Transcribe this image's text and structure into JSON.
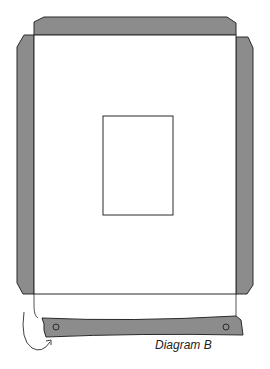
{
  "diagram": {
    "caption": "Diagram B",
    "colors": {
      "flap_fill": "#8c8c8c",
      "outline": "#2a2a2a",
      "panel_fill": "#ffffff",
      "background": "#ffffff"
    },
    "parts": {
      "top_flap": "top-flap",
      "left_flap": "left-flap",
      "right_flap": "right-flap",
      "main_panel": "main-panel",
      "window": "center-window",
      "bottom_strip": "fold-strip",
      "bottom_tab": "bottom-tab",
      "fold_arrow": "curved-fold-arrow",
      "holes": [
        "left-hole",
        "right-hole"
      ]
    }
  }
}
